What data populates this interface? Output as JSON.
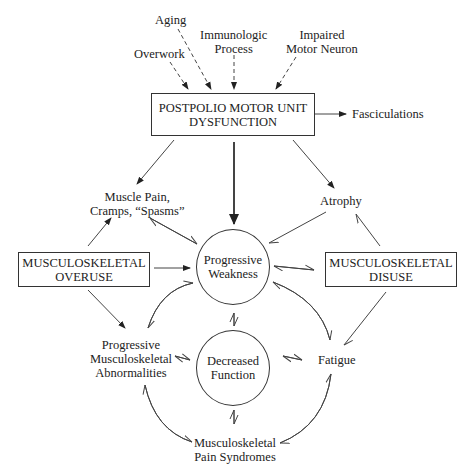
{
  "diagram": {
    "causes": {
      "aging": "Aging",
      "overwork": "Overwork",
      "immunologic": [
        "Immunologic",
        "Process"
      ],
      "impaired": [
        "Impaired",
        "Motor Neuron"
      ]
    },
    "postpolio_box": [
      "POSTPOLIO MOTOR UNIT",
      "DYSFUNCTION"
    ],
    "fasciculations": "Fasciculations",
    "muscle_pain": [
      "Muscle Pain,",
      "Cramps, “Spasms”"
    ],
    "atrophy": "Atrophy",
    "overuse_box": [
      "MUSCULOSKELETAL",
      "OVERUSE"
    ],
    "disuse_box": [
      "MUSCULOSKELETAL",
      "DISUSE"
    ],
    "progressive_weakness": [
      "Progressive",
      "Weakness"
    ],
    "decreased_function": [
      "Decreased",
      "Function"
    ],
    "abnormalities": [
      "Progressive",
      "Musculoskeletal",
      "Abnormalities"
    ],
    "fatigue": "Fatigue",
    "pain_syndromes": [
      "Musculoskeletal",
      "Pain Syndromes"
    ]
  }
}
